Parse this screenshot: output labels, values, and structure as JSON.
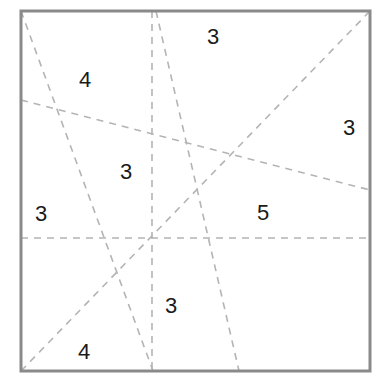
{
  "figure": {
    "canvas": {
      "width": 391,
      "height": 388,
      "background": "#ffffff"
    },
    "frame": {
      "name": "square-border",
      "x": 21,
      "y": 11,
      "width": 349,
      "height": 360,
      "stroke_color": "#8a8a8a",
      "stroke_width": 3
    },
    "line_style": {
      "stroke_color": "#b4b4b4",
      "stroke_width": 1.6,
      "dash_pattern": "7 6"
    },
    "lines": [
      {
        "name": "horizontal-midline",
        "x1": 21,
        "y1": 238,
        "x2": 370,
        "y2": 238,
        "orientation": "horizontal"
      },
      {
        "name": "vertical-centerline",
        "x1": 152,
        "y1": 11,
        "x2": 152,
        "y2": 371,
        "orientation": "vertical"
      },
      {
        "name": "diagonal-topleft-to-bottomcenter",
        "x1": 21,
        "y1": 11,
        "x2": 153,
        "y2": 371,
        "orientation": "steep-right-leaning"
      },
      {
        "name": "diagonal-topcenter-to-bottomright",
        "x1": 156,
        "y1": 11,
        "x2": 239,
        "y2": 371,
        "orientation": "steep-right-leaning"
      },
      {
        "name": "shallow-diagonal-left-to-right",
        "x1": 21,
        "y1": 100,
        "x2": 370,
        "y2": 190,
        "orientation": "shallow-descending"
      },
      {
        "name": "main-diagonal-bottomleft-to-topright",
        "x1": 21,
        "y1": 371,
        "x2": 370,
        "y2": 11,
        "orientation": "ascending"
      }
    ],
    "labels": [
      {
        "name": "region-count-top",
        "text": "3",
        "x": 213,
        "y": 37
      },
      {
        "name": "region-count-upper-left",
        "text": "4",
        "x": 85,
        "y": 80
      },
      {
        "name": "region-count-right",
        "text": "3",
        "x": 349,
        "y": 128
      },
      {
        "name": "region-count-center",
        "text": "3",
        "x": 126,
        "y": 172
      },
      {
        "name": "region-count-left",
        "text": "3",
        "x": 41,
        "y": 214
      },
      {
        "name": "region-count-center-right",
        "text": "5",
        "x": 263,
        "y": 213
      },
      {
        "name": "region-count-lower-center",
        "text": "3",
        "x": 171,
        "y": 306
      },
      {
        "name": "region-count-bottom-left",
        "text": "4",
        "x": 84,
        "y": 352
      }
    ]
  }
}
